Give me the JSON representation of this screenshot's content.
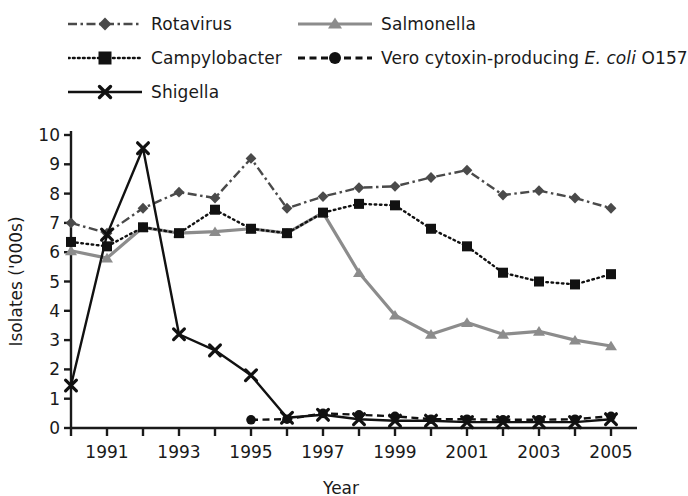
{
  "chart_data": {
    "type": "line",
    "title": "",
    "xlabel": "Year",
    "ylabel": "Isolates ('000s)",
    "xlim": [
      1990,
      2005
    ],
    "ylim": [
      0,
      10
    ],
    "yticks": [
      0,
      1,
      2,
      3,
      4,
      5,
      6,
      7,
      8,
      9,
      10
    ],
    "ytick_labels": [
      "0",
      "1",
      "2",
      "3",
      "4",
      "5",
      "6",
      "7",
      "8",
      "9",
      "10"
    ],
    "xticks": [
      1990,
      1991,
      1992,
      1993,
      1994,
      1995,
      1996,
      1997,
      1998,
      1999,
      2000,
      2001,
      2002,
      2003,
      2004,
      2005
    ],
    "xtick_labels": [
      "",
      "1991",
      "",
      "1993",
      "",
      "1995",
      "",
      "1997",
      "",
      "1999",
      "",
      "2001",
      "",
      "2003",
      "",
      "2005"
    ],
    "grid": false,
    "legend_position": "top",
    "x": [
      1990,
      1991,
      1992,
      1993,
      1994,
      1995,
      1996,
      1997,
      1998,
      1999,
      2000,
      2001,
      2002,
      2003,
      2004,
      2005
    ],
    "series": [
      {
        "name": "Rotavirus",
        "color": "#4a4a4a",
        "marker": "diamond",
        "dash": "dashdot",
        "values": [
          7.0,
          6.65,
          7.5,
          8.05,
          7.85,
          9.2,
          7.5,
          7.9,
          8.2,
          8.25,
          8.55,
          8.8,
          7.95,
          8.1,
          7.85,
          7.5
        ]
      },
      {
        "name": "Salmonella",
        "color": "#8c8c8c",
        "marker": "triangle",
        "dash": "solid",
        "values": [
          6.05,
          5.8,
          6.85,
          6.65,
          6.7,
          6.8,
          6.65,
          7.35,
          5.3,
          3.85,
          3.2,
          3.6,
          3.2,
          3.3,
          3.0,
          2.8
        ]
      },
      {
        "name": "Campylobacter",
        "color": "#111111",
        "marker": "square",
        "dash": "dotted",
        "values": [
          6.35,
          6.2,
          6.85,
          6.65,
          7.45,
          6.8,
          6.65,
          7.35,
          7.65,
          7.6,
          6.8,
          6.2,
          5.3,
          5.0,
          4.9,
          5.25
        ]
      },
      {
        "name": "Vero cytoxin-producing E. coli O157",
        "color": "#111111",
        "marker": "circle",
        "dash": "dashed",
        "values": [
          null,
          null,
          null,
          null,
          null,
          0.28,
          0.3,
          0.5,
          0.45,
          0.4,
          0.3,
          0.3,
          0.28,
          0.28,
          0.3,
          0.4
        ]
      },
      {
        "name": "Shigella",
        "color": "#111111",
        "marker": "x",
        "dash": "solid",
        "values": [
          1.45,
          6.6,
          9.55,
          3.2,
          2.65,
          1.8,
          0.35,
          0.45,
          0.3,
          0.25,
          0.25,
          0.2,
          0.2,
          0.2,
          0.2,
          0.3
        ]
      }
    ]
  },
  "legend": {
    "items": [
      {
        "label": "Rotavirus",
        "series": 0
      },
      {
        "label": "Salmonella",
        "series": 1
      },
      {
        "label": "Campylobacter",
        "series": 2
      },
      {
        "label_pre": "Vero cytoxin-producing ",
        "label_italic": "E. coli",
        "label_post": " O157",
        "series": 3
      },
      {
        "label": "Shigella",
        "series": 4
      }
    ]
  }
}
